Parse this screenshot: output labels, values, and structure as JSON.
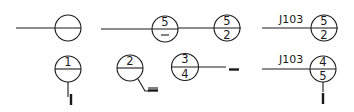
{
  "diagram": {
    "title": "",
    "symbols": [
      {
        "id": "sym-1",
        "kind": "detail-callout",
        "label": "",
        "top": "",
        "bottom": "",
        "leader": "left-horizontal"
      },
      {
        "id": "sym-2",
        "kind": "detail-callout",
        "label": "",
        "top": "5",
        "bottom": "—",
        "leader": "left-horizontal"
      },
      {
        "id": "sym-3",
        "kind": "detail-callout",
        "label": "",
        "top": "5",
        "bottom": "2",
        "leader": "left-horizontal"
      },
      {
        "id": "sym-4",
        "kind": "detail-callout",
        "label": "J103",
        "top": "5",
        "bottom": "2",
        "leader": "left-horizontal"
      },
      {
        "id": "sym-5",
        "kind": "section-callout",
        "label": "",
        "top": "1",
        "bottom": "",
        "leader": "down-vertical"
      },
      {
        "id": "sym-6",
        "kind": "section-callout",
        "label": "",
        "top": "2",
        "bottom": "",
        "leader": "down-right-bent"
      },
      {
        "id": "sym-7",
        "kind": "section-callout",
        "label": "",
        "top": "3",
        "bottom": "4",
        "leader": "right-horizontal"
      },
      {
        "id": "sym-8",
        "kind": "section-callout",
        "label": "J103",
        "top": "4",
        "bottom": "5",
        "leader": "left-horizontal-and-down"
      }
    ],
    "colors": {
      "stroke": "#1a1a1a",
      "background": "#ffffff"
    }
  }
}
